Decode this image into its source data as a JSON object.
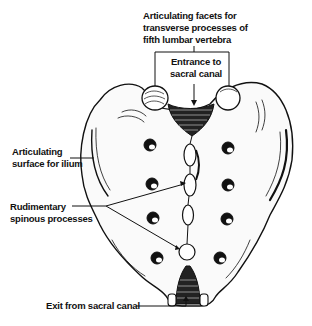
{
  "diagram": {
    "labels": {
      "facets": {
        "lines": [
          "Articulating facets for",
          "transverse processes of",
          "fifth lumbar vertebra"
        ]
      },
      "entrance": {
        "lines": [
          "Entrance to",
          "sacral canal"
        ]
      },
      "ilium": {
        "lines": [
          "Articulating",
          "surface for ilium"
        ]
      },
      "spinous": {
        "lines": [
          "Rudimentary",
          "spinous processes"
        ]
      },
      "exit": {
        "lines": [
          "Exit from sacral canal"
        ]
      }
    },
    "colors": {
      "ink": "#111111",
      "background": "#ffffff"
    }
  }
}
